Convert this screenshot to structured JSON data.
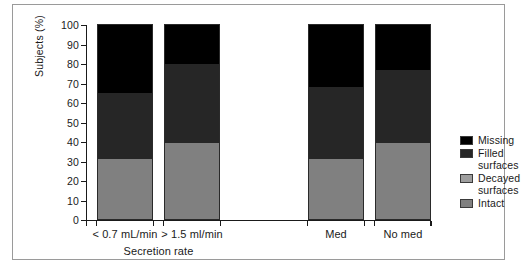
{
  "chart_data": {
    "type": "bar",
    "stacked": true,
    "title": "",
    "xlabel": "Secretion rate",
    "ylabel": "Subjects (%)",
    "ylim": [
      0,
      100
    ],
    "ytick_labels": [
      "0",
      "10",
      "20",
      "30",
      "40",
      "50",
      "60",
      "70",
      "80",
      "90",
      "100"
    ],
    "ytick_values": [
      0,
      10,
      20,
      30,
      40,
      50,
      60,
      70,
      80,
      90,
      100
    ],
    "grid": false,
    "legend_position": "right",
    "categories": [
      "< 0.7 mL/min",
      "> 1.5 ml/min",
      "Med",
      "No med"
    ],
    "groups": [
      {
        "name": "Secretion rate",
        "categories": [
          "< 0.7 mL/min",
          "> 1.5 ml/min"
        ]
      },
      {
        "name": "",
        "categories": [
          "Med",
          "No med"
        ]
      }
    ],
    "series": [
      {
        "name": "Intact",
        "color": "#808080",
        "values": [
          31,
          39,
          31,
          39
        ]
      },
      {
        "name": "Decayed surfaces",
        "color": "#9e9e9e",
        "values": [
          0,
          0,
          0,
          0
        ]
      },
      {
        "name": "Filled surfaces",
        "color": "#262626",
        "values": [
          34,
          41,
          37,
          38
        ]
      },
      {
        "name": "Missing",
        "color": "#000000",
        "values": [
          35,
          20,
          32,
          23
        ]
      }
    ],
    "stack_order_bottom_to_top": [
      "Intact",
      "Decayed surfaces",
      "Filled surfaces",
      "Missing"
    ]
  },
  "axes": {
    "y_title": "Subjects (%)",
    "x_title": "Secretion rate",
    "ticks_y": [
      "100",
      "90",
      "80",
      "70",
      "60",
      "50",
      "40",
      "30",
      "20",
      "10",
      "0"
    ]
  },
  "bars": [
    {
      "label": "< 0.7 mL/min",
      "segments": [
        {
          "name": "Missing",
          "value": 35,
          "color": "#000000"
        },
        {
          "name": "Filled surfaces",
          "value": 34,
          "color": "#262626"
        },
        {
          "name": "Decayed surfaces",
          "value": 0,
          "color": "#9e9e9e"
        },
        {
          "name": "Intact",
          "value": 31,
          "color": "#808080"
        }
      ]
    },
    {
      "label": "> 1.5 ml/min",
      "segments": [
        {
          "name": "Missing",
          "value": 20,
          "color": "#000000"
        },
        {
          "name": "Filled surfaces",
          "value": 41,
          "color": "#262626"
        },
        {
          "name": "Decayed surfaces",
          "value": 0,
          "color": "#9e9e9e"
        },
        {
          "name": "Intact",
          "value": 39,
          "color": "#808080"
        }
      ]
    },
    {
      "label": "Med",
      "segments": [
        {
          "name": "Missing",
          "value": 32,
          "color": "#000000"
        },
        {
          "name": "Filled surfaces",
          "value": 37,
          "color": "#262626"
        },
        {
          "name": "Decayed surfaces",
          "value": 0,
          "color": "#9e9e9e"
        },
        {
          "name": "Intact",
          "value": 31,
          "color": "#808080"
        }
      ]
    },
    {
      "label": "No med",
      "segments": [
        {
          "name": "Missing",
          "value": 23,
          "color": "#000000"
        },
        {
          "name": "Filled surfaces",
          "value": 38,
          "color": "#262626"
        },
        {
          "name": "Decayed surfaces",
          "value": 0,
          "color": "#9e9e9e"
        },
        {
          "name": "Intact",
          "value": 39,
          "color": "#808080"
        }
      ]
    }
  ],
  "legend": {
    "items": [
      {
        "label": "Missing",
        "color": "#000000"
      },
      {
        "label": "Filled\nsurfaces",
        "color": "#262626"
      },
      {
        "label": "Decayed\nsurfaces",
        "color": "#9e9e9e"
      },
      {
        "label": "Intact",
        "color": "#808080"
      }
    ]
  },
  "colors": {
    "missing": "#000000",
    "filled_surfaces": "#262626",
    "decayed_surfaces": "#9e9e9e",
    "intact": "#808080",
    "axis": "#1a1a1a",
    "frame": "#9a9a9a",
    "background": "#ffffff"
  }
}
